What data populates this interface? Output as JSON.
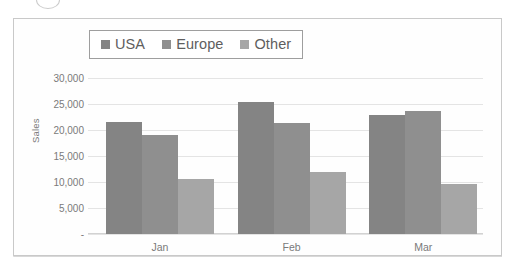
{
  "chart_data": {
    "type": "bar",
    "title": "",
    "subtitle": "",
    "xlabel": "",
    "ylabel": "Sales",
    "categories": [
      "Jan",
      "Feb",
      "Mar"
    ],
    "series": [
      {
        "name": "USA",
        "color": "#848484",
        "values": [
          21500,
          25400,
          22900
        ]
      },
      {
        "name": "Europe",
        "color": "#8f8f8f",
        "values": [
          19000,
          21300,
          23700
        ]
      },
      {
        "name": "Other",
        "color": "#a6a6a6",
        "values": [
          10600,
          11900,
          9600
        ]
      }
    ],
    "ylim": [
      0,
      30000
    ],
    "ytick_values": [
      30000,
      25000,
      20000,
      15000,
      10000,
      5000,
      0
    ],
    "ytick_labels": [
      "30,000",
      "25,000",
      "20,000",
      "15,000",
      "10,000",
      "5,000",
      "-"
    ],
    "grid": true,
    "legend_position": "top"
  },
  "legend": {
    "entries": [
      {
        "label": "USA"
      },
      {
        "label": "Europe"
      },
      {
        "label": "Other"
      }
    ]
  }
}
